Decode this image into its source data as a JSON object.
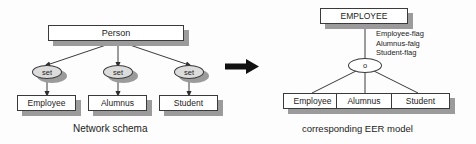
{
  "diagram": {
    "title_left": "Network schema",
    "title_right": "corresponding EER model",
    "transform_arrow": "right-arrow-icon"
  },
  "network_schema": {
    "root": {
      "label": "Person"
    },
    "set_nodes": [
      {
        "label": "set"
      },
      {
        "label": "set"
      },
      {
        "label": "set"
      }
    ],
    "record_types": [
      {
        "label": "Employee"
      },
      {
        "label": "Alumnus"
      },
      {
        "label": "Student"
      }
    ],
    "caption": "Network schema"
  },
  "eer_model": {
    "superclass": {
      "label": "EMPLOYEE"
    },
    "attributes": [
      "Employee-flag",
      "Alumnus-falg",
      "Student-flag"
    ],
    "specialization_circle": {
      "label": "o"
    },
    "subclasses": [
      {
        "label": "Employee"
      },
      {
        "label": "Alumnus"
      },
      {
        "label": "Student"
      }
    ],
    "caption": "corresponding EER model"
  },
  "colors": {
    "line": "#3a3a3a",
    "shadow": "#9b9b9b",
    "ellipse_fill": "#dcdcdc",
    "box_fill": "#ffffff",
    "text": "#1c1c1c",
    "arrow": "#111111",
    "background": "#fdfdfd"
  }
}
